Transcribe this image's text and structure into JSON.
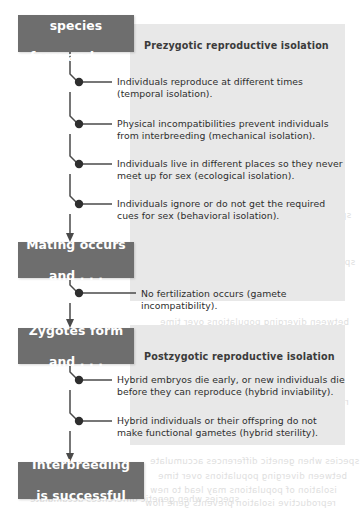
{
  "diagram": {
    "colors": {
      "box_fill": "#6e6e6e",
      "box_text": "#ffffff",
      "panel_fill": "#e8e8e8",
      "line": "#4a4a4a",
      "body_text": "#2d2d2d"
    },
    "stages": [
      {
        "id": "different-species",
        "line1": "Different species",
        "line2": "form and . . ."
      },
      {
        "id": "mating-occurs",
        "line1": "Mating occurs",
        "line2": "and . . ."
      },
      {
        "id": "zygotes-form",
        "line1": "Zygotes form",
        "line2": "and . . ."
      },
      {
        "id": "interbreeding-successful",
        "line1": "Interbreeding",
        "line2": "is successful"
      }
    ],
    "panels": [
      {
        "id": "prezygotic",
        "title": "Prezygotic reproductive isolation"
      },
      {
        "id": "postzygotic",
        "title": "Postzygotic reproductive isolation"
      }
    ],
    "prezygotic_items": [
      {
        "line1": "Individuals reproduce at different times",
        "line2": "(temporal isolation)."
      },
      {
        "line1": "Physical incompatibilities prevent individuals",
        "line2": "from interbreeding (mechanical isolation)."
      },
      {
        "line1": "Individuals live in different places so they never",
        "line2": "meet up for sex (ecological isolation)."
      },
      {
        "line1": "Individuals ignore or do not get the required",
        "line2": "cues for sex (behavioral isolation)."
      }
    ],
    "mating_items": [
      {
        "line1": "No fertilization occurs (gamete incompatibility).",
        "line2": ""
      }
    ],
    "postzygotic_items": [
      {
        "line1": "Hybrid embryos die early, or new individuals die",
        "line2": "before they can reproduce (hybrid inviability)."
      },
      {
        "line1": "Hybrid individuals or their offspring do not",
        "line2": "make functional gametes (hybrid sterility)."
      }
    ],
    "ghost_text": [
      "isolation of populations may lead to new",
      "species when genetic differences accumulate",
      "reproductive isolation prevents gene flow",
      "between diverging populations over time"
    ]
  }
}
